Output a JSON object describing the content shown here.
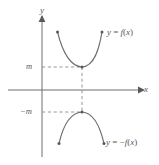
{
  "figure": {
    "kind": "math-graph",
    "background_color": "#ffffff",
    "ink_color": "#58595b",
    "curve_color": "#6d6e71",
    "dash_color": "#8a8c8e"
  },
  "axes": {
    "x_label": "x",
    "y_label": "y",
    "x_axis_y_px": 90,
    "y_axis_x_px": 42,
    "x_axis_from_px": 8,
    "x_axis_to_px": 142,
    "y_axis_from_px": 14,
    "y_axis_to_px": 157
  },
  "ticks": [
    {
      "name": "m-tick",
      "label": "m",
      "value": "m",
      "y_px": 67
    },
    {
      "name": "negative-m-tick",
      "label": "−m",
      "value": "-m",
      "y_px": 112
    }
  ],
  "curves": [
    {
      "name": "upper-curve",
      "label_html": "<i>y</i> = <i>f</i>(<i>x</i>)",
      "label_text": "y = f(x)",
      "opens": "up",
      "vertex": {
        "x_px": 82,
        "y_px": 67,
        "value": "m"
      },
      "endpoints": [
        {
          "x_px": 57,
          "y_px": 31
        },
        {
          "x_px": 102,
          "y_px": 31
        }
      ]
    },
    {
      "name": "lower-curve",
      "label_html": "<i>y</i> = −<i>f</i>(<i>x</i>)",
      "label_text": "y = -f(x)",
      "opens": "down",
      "vertex": {
        "x_px": 82,
        "y_px": 112,
        "value": "-m"
      },
      "endpoints": [
        {
          "x_px": 59,
          "y_px": 144
        },
        {
          "x_px": 104,
          "y_px": 144
        }
      ]
    }
  ],
  "guides": [
    {
      "name": "m-horizontal-guide",
      "from_px": [
        42,
        67
      ],
      "to_px": [
        82,
        67
      ]
    },
    {
      "name": "vertex-vertical-guide",
      "from_px": [
        82,
        67
      ],
      "to_px": [
        82,
        112
      ]
    },
    {
      "name": "negative-m-horizontal-guide",
      "from_px": [
        42,
        112
      ],
      "to_px": [
        82,
        112
      ]
    }
  ],
  "chart_data": {
    "type": "line",
    "title": "",
    "xlabel": "x",
    "ylabel": "y",
    "grid": false,
    "legend": "inline-annotations",
    "annotations": [
      "y = f(x)",
      "y = -f(x)",
      "m",
      "-m"
    ],
    "series": [
      {
        "name": "y = f(x)",
        "x": [
          -1.0,
          -0.75,
          -0.5,
          -0.25,
          0.0,
          0.25,
          0.5,
          0.75,
          1.0
        ],
        "y": [
          2.6,
          1.85,
          1.25,
          0.85,
          0.7,
          0.78,
          1.05,
          1.7,
          2.6
        ],
        "minimum": {
          "x": 0.0,
          "y": "m"
        }
      },
      {
        "name": "y = -f(x)",
        "x": [
          -1.0,
          -0.75,
          -0.5,
          -0.25,
          0.0,
          0.25,
          0.5,
          0.75,
          1.0
        ],
        "y": [
          -2.6,
          -1.85,
          -1.25,
          -0.85,
          -0.7,
          -0.78,
          -1.05,
          -1.7,
          -2.6
        ],
        "maximum": {
          "x": 0.0,
          "y": "-m"
        }
      }
    ],
    "ylim": [
      -3.2,
      3.2
    ],
    "xlim": [
      -1.6,
      1.9
    ]
  }
}
